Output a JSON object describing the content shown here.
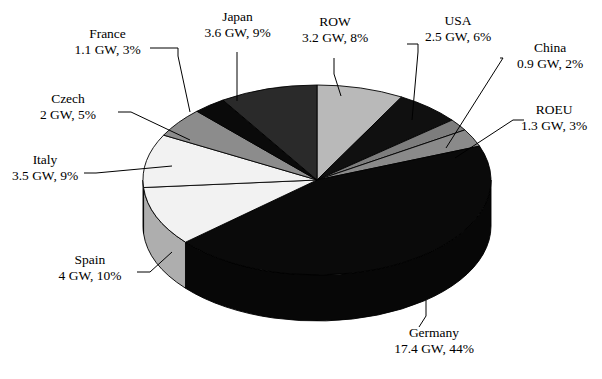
{
  "chart_data": {
    "type": "pie",
    "title": "",
    "unit": "GW",
    "total_gw": 39.5,
    "three_d": true,
    "legend": "none",
    "labels_position": "outside-with-leader-lines",
    "categories": [
      "Germany",
      "Spain",
      "Italy",
      "Czech",
      "France",
      "Japan",
      "ROW",
      "USA",
      "China",
      "ROEU"
    ],
    "values": [
      17.4,
      4,
      3.5,
      2,
      1.1,
      3.6,
      3.2,
      2.5,
      0.9,
      1.3
    ],
    "percentages": [
      44,
      10,
      9,
      5,
      3,
      9,
      8,
      6,
      2,
      3
    ],
    "value_labels": [
      "17.4 GW, 44%",
      "4 GW, 10%",
      "3.5 GW, 9%",
      "2 GW, 5%",
      "1.1 GW, 3%",
      "3.6 GW, 9%",
      "3.2 GW, 8%",
      "2.5 GW, 6%",
      "0.9 GW, 2%",
      "1.3 GW, 3%"
    ],
    "slice_colors": [
      "#0a0a0a",
      "#f2f2f2",
      "#f2f2f2",
      "#8c8c8c",
      "#0a0a0a",
      "#2a2a2a",
      "#b9b9b9",
      "#101010",
      "#7d7d7d",
      "#8a8a8a"
    ]
  },
  "slices": [
    {
      "name": "ROW",
      "value": "3.2",
      "label": "ROW",
      "value_label": "3.2 GW, 8%",
      "percent": 8,
      "color": "#b9b9b9"
    },
    {
      "name": "USA",
      "value": "2.5",
      "label": "USA",
      "value_label": "2.5 GW, 6%",
      "percent": 6,
      "color": "#101010"
    },
    {
      "name": "China",
      "value": "0.9",
      "label": "China",
      "value_label": "0.9 GW, 2%",
      "percent": 2,
      "color": "#7d7d7d"
    },
    {
      "name": "ROEU",
      "value": "1.3",
      "label": "ROEU",
      "value_label": "1.3 GW, 3%",
      "percent": 3,
      "color": "#8a8a8a"
    },
    {
      "name": "Germany",
      "value": "17.4",
      "label": "Germany",
      "value_label": "17.4 GW, 44%",
      "percent": 44,
      "color": "#0a0a0a"
    },
    {
      "name": "Spain",
      "value": "4",
      "label": "Spain",
      "value_label": "4 GW, 10%",
      "percent": 10,
      "color": "#f2f2f2"
    },
    {
      "name": "Italy",
      "value": "3.5",
      "label": "Italy",
      "value_label": "3.5 GW, 9%",
      "percent": 9,
      "color": "#f2f2f2"
    },
    {
      "name": "Czech",
      "value": "2",
      "label": "Czech",
      "value_label": "2 GW, 5%",
      "percent": 5,
      "color": "#8c8c8c"
    },
    {
      "name": "France",
      "value": "1.1",
      "label": "France",
      "value_label": "1.1 GW, 3%",
      "percent": 3,
      "color": "#0a0a0a"
    },
    {
      "name": "Japan",
      "value": "3.6",
      "label": "Japan",
      "value_label": "3.6 GW, 9%",
      "percent": 9,
      "color": "#2a2a2a"
    }
  ]
}
